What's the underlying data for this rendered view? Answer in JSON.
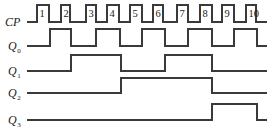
{
  "diagram": {
    "type": "timing-diagram",
    "line_color": "#3a3a3a",
    "signals": [
      {
        "name": "CP",
        "label_main": "CP",
        "label_sub": "",
        "y_low": 22,
        "y_high": 5,
        "start_x": 27,
        "end_x": 267,
        "edges": [
          37,
          49,
          61,
          70,
          86,
          96,
          107,
          119,
          130,
          142,
          153,
          163,
          177,
          188,
          200,
          212,
          222,
          234,
          246,
          256
        ]
      },
      {
        "name": "Q0",
        "label_main": "Q",
        "label_sub": "0",
        "y_low": 46,
        "y_high": 29,
        "start_x": 27,
        "end_x": 267,
        "edges": [
          50,
          71,
          96,
          120,
          142,
          165,
          188,
          212,
          234,
          257
        ]
      },
      {
        "name": "Q1",
        "label_main": "Q",
        "label_sub": "1",
        "y_low": 71,
        "y_high": 55,
        "start_x": 27,
        "end_x": 267,
        "edges": [
          71,
          121,
          165,
          212
        ]
      },
      {
        "name": "Q2",
        "label_main": "Q",
        "label_sub": "2",
        "y_low": 93,
        "y_high": 78,
        "start_x": 27,
        "end_x": 267,
        "edges": [
          121,
          212
        ]
      },
      {
        "name": "Q3",
        "label_main": "Q",
        "label_sub": "3",
        "y_low": 120,
        "y_high": 104,
        "start_x": 27,
        "end_x": 267,
        "edges": [
          212,
          257
        ]
      }
    ],
    "pulse_numbers": [
      "1",
      "2",
      "3",
      "4",
      "5",
      "6",
      "7",
      "8",
      "9",
      "10"
    ]
  }
}
